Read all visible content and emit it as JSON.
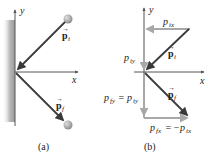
{
  "figure": {
    "panels": [
      {
        "id": "a",
        "caption": "(a)",
        "axes": {
          "x_label": "x",
          "y_label": "y"
        },
        "vectors": [
          {
            "name": "p_i",
            "label_main": "p",
            "label_sub": "i",
            "arrow": "→"
          },
          {
            "name": "p_f",
            "label_main": "p",
            "label_sub": "f",
            "arrow": "→"
          }
        ],
        "objects": [
          "wall",
          "ball-initial",
          "ball-final"
        ]
      },
      {
        "id": "b",
        "caption": "(b)",
        "axes": {
          "x_label": "x",
          "y_label": "y"
        },
        "vectors": [
          {
            "name": "p_i",
            "label_main": "p",
            "label_sub": "i",
            "arrow": "→"
          },
          {
            "name": "p_f",
            "label_main": "p",
            "label_sub": "f",
            "arrow": "→"
          }
        ],
        "components": [
          {
            "name": "p_ix",
            "main": "p",
            "sub": "ix"
          },
          {
            "name": "p_iy",
            "main": "p",
            "sub": "iy"
          },
          {
            "name": "p_fy",
            "main": "p",
            "sub": "fy",
            "eq": " = ",
            "rhs_main": "p",
            "rhs_sub": "iy"
          },
          {
            "name": "p_fx",
            "main": "p",
            "sub": "fx",
            "eq": " = −",
            "rhs_main": "p",
            "rhs_sub": "ix"
          }
        ]
      }
    ],
    "colors": {
      "vector": "#3a3a3a",
      "component": "#a8a8a8",
      "axis": "#555555",
      "ball": "#9a9a9a",
      "wall": "#b0b0b0"
    }
  }
}
